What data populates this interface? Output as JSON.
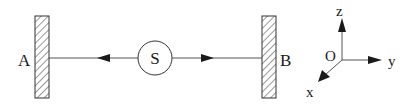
{
  "diagram": {
    "walls": [
      {
        "id": "A",
        "label": "A"
      },
      {
        "id": "B",
        "label": "B"
      }
    ],
    "source": {
      "label": "S"
    },
    "axes": {
      "origin": "O",
      "x": "x",
      "y": "y",
      "z": "z"
    },
    "colors": {
      "stroke": "#1a1a1a",
      "line": "#555555",
      "background": "#ffffff"
    }
  }
}
